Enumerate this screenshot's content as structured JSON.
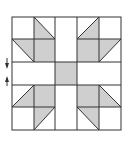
{
  "diagram": {
    "type": "quilt-block",
    "grid": {
      "cols": 5,
      "rows": 5
    },
    "colors": {
      "background": "#ffffff",
      "fill": "#cfcfcf",
      "stroke": "#333333"
    },
    "cells": [
      {
        "r": 0,
        "c": 0,
        "kind": "plain"
      },
      {
        "r": 0,
        "c": 1,
        "kind": "hst",
        "gray": "bl",
        "diag": "tl-br"
      },
      {
        "r": 0,
        "c": 2,
        "kind": "strip-v"
      },
      {
        "r": 0,
        "c": 3,
        "kind": "hst",
        "gray": "br",
        "diag": "tr-bl"
      },
      {
        "r": 0,
        "c": 4,
        "kind": "plain"
      },
      {
        "r": 1,
        "c": 0,
        "kind": "hst",
        "gray": "tr",
        "diag": "tl-br"
      },
      {
        "r": 1,
        "c": 1,
        "kind": "solid"
      },
      {
        "r": 1,
        "c": 2,
        "kind": "strip-v"
      },
      {
        "r": 1,
        "c": 3,
        "kind": "solid"
      },
      {
        "r": 1,
        "c": 4,
        "kind": "hst",
        "gray": "tl",
        "diag": "tr-bl"
      },
      {
        "r": 2,
        "c": 0,
        "kind": "strip-h"
      },
      {
        "r": 2,
        "c": 1,
        "kind": "strip-h"
      },
      {
        "r": 2,
        "c": 2,
        "kind": "solid"
      },
      {
        "r": 2,
        "c": 3,
        "kind": "strip-h"
      },
      {
        "r": 2,
        "c": 4,
        "kind": "strip-h"
      },
      {
        "r": 3,
        "c": 0,
        "kind": "hst",
        "gray": "br",
        "diag": "tr-bl"
      },
      {
        "r": 3,
        "c": 1,
        "kind": "solid"
      },
      {
        "r": 3,
        "c": 2,
        "kind": "strip-v"
      },
      {
        "r": 3,
        "c": 3,
        "kind": "solid"
      },
      {
        "r": 3,
        "c": 4,
        "kind": "hst",
        "gray": "bl",
        "diag": "tl-br"
      },
      {
        "r": 4,
        "c": 0,
        "kind": "plain"
      },
      {
        "r": 4,
        "c": 1,
        "kind": "hst",
        "gray": "tr",
        "diag": "tr-bl"
      },
      {
        "r": 4,
        "c": 2,
        "kind": "strip-v"
      },
      {
        "r": 4,
        "c": 3,
        "kind": "hst",
        "gray": "tl",
        "diag": "tl-br"
      },
      {
        "r": 4,
        "c": 4,
        "kind": "plain"
      }
    ],
    "annotations": [
      {
        "type": "arrow",
        "direction": "down",
        "label": ""
      },
      {
        "type": "arrow",
        "direction": "up",
        "label": ""
      }
    ]
  }
}
